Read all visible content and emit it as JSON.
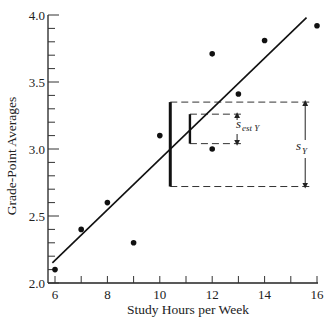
{
  "chart_data": {
    "type": "scatter",
    "title": "",
    "xlabel": "Study Hours per Week",
    "ylabel": "Grade-Point Averages",
    "xlim": [
      6,
      16
    ],
    "ylim": [
      2.0,
      4.0
    ],
    "x_ticks": [
      6,
      8,
      10,
      12,
      14,
      16
    ],
    "x_tick_labels": [
      "6",
      "8",
      "10",
      "12",
      "14",
      "16"
    ],
    "x_minor_step": 1,
    "y_ticks": [
      2.0,
      2.5,
      3.0,
      3.5,
      4.0
    ],
    "y_tick_labels": [
      "2.0",
      "2.5",
      "3.0",
      "3.5",
      "4.0"
    ],
    "y_minor_step": 0.1,
    "grid": false,
    "legend": null,
    "points": [
      {
        "x": 6,
        "y": 2.1
      },
      {
        "x": 7,
        "y": 2.4
      },
      {
        "x": 8,
        "y": 2.6
      },
      {
        "x": 9,
        "y": 2.3
      },
      {
        "x": 10,
        "y": 3.1
      },
      {
        "x": 12,
        "y": 3.0
      },
      {
        "x": 12,
        "y": 3.71
      },
      {
        "x": 13,
        "y": 3.41
      },
      {
        "x": 14,
        "y": 3.81
      },
      {
        "x": 16,
        "y": 3.92
      }
    ],
    "regression_line": {
      "x1": 5.9,
      "y1": 2.15,
      "x2": 15.6,
      "y2": 3.98
    },
    "annotations": [
      {
        "name": "s_Y",
        "label": "s",
        "subscript": "Y",
        "description": "Standard deviation of Y shown as thick vertical bar with dashed horizontal bounds and a double-headed arrow",
        "bar_x": 10.4,
        "y_low": 2.72,
        "y_high": 3.35,
        "arrow_x": 15.55,
        "dash_end_x": 15.85
      },
      {
        "name": "s_est_Y",
        "label": "s",
        "subscript": "est Y",
        "description": "Standard error of estimate shown as smaller bracket with dashed bounds and double-headed arrow",
        "bar_x": 11.15,
        "y_low": 3.04,
        "y_high": 3.26,
        "arrow_x": 12.95,
        "dash_end_x": 13.2
      }
    ]
  },
  "labels": {
    "xlabel": "Study Hours per Week",
    "ylabel": "Grade-Point Averages",
    "s_y": "s",
    "s_y_sub": "Y",
    "s_est": "s",
    "s_est_sub": "est Y"
  }
}
